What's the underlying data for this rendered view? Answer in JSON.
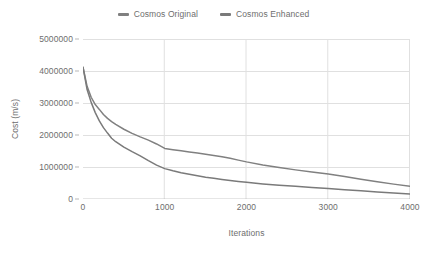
{
  "chart_data": {
    "type": "line",
    "title": "",
    "xlabel": "Iterations",
    "ylabel": "Cost (m/s)",
    "xlim": [
      0,
      4000
    ],
    "ylim": [
      0,
      5000000
    ],
    "grid": true,
    "legend_position": "top-center",
    "xticks": [
      0,
      1000,
      2000,
      3000,
      4000
    ],
    "xticklabels": [
      "0",
      "1000",
      "2000",
      "3000",
      "4000"
    ],
    "yticks": [
      0,
      1000000,
      2000000,
      3000000,
      4000000,
      5000000
    ],
    "yticklabels": [
      "0",
      "1000000",
      "2000000",
      "3000000",
      "4000000",
      "5000000"
    ],
    "x": [
      0,
      50,
      100,
      150,
      200,
      250,
      300,
      350,
      400,
      500,
      600,
      700,
      800,
      900,
      1000,
      1100,
      1200,
      1300,
      1400,
      1500,
      1600,
      1700,
      1800,
      1900,
      2000,
      2200,
      2400,
      2600,
      2800,
      3000,
      3200,
      3400,
      3600,
      3800,
      4000
    ],
    "series": [
      {
        "name": "Cosmos Original",
        "color": "#808080",
        "values": [
          4120000,
          3520000,
          3180000,
          2950000,
          2800000,
          2640000,
          2520000,
          2420000,
          2330000,
          2180000,
          2050000,
          1940000,
          1840000,
          1720000,
          1580000,
          1540000,
          1505000,
          1470000,
          1435000,
          1400000,
          1360000,
          1320000,
          1270000,
          1215000,
          1160000,
          1065000,
          985000,
          910000,
          845000,
          780000,
          700000,
          620000,
          540000,
          465000,
          400000
        ]
      },
      {
        "name": "Cosmos Enhanced",
        "color": "#7a7a7a",
        "values": [
          4120000,
          3420000,
          3020000,
          2700000,
          2440000,
          2230000,
          2060000,
          1900000,
          1790000,
          1620000,
          1480000,
          1350000,
          1200000,
          1060000,
          950000,
          880000,
          820000,
          770000,
          725000,
          680000,
          645000,
          610000,
          575000,
          545000,
          520000,
          470000,
          430000,
          395000,
          360000,
          325000,
          290000,
          255000,
          220000,
          185000,
          155000
        ]
      }
    ]
  },
  "legend": {
    "entries": [
      {
        "label": "Cosmos Original"
      },
      {
        "label": "Cosmos Enhanced"
      }
    ]
  },
  "colors": {
    "series_original": "#808080",
    "series_enhanced": "#7a7a7a",
    "grid": "#e0e0e0",
    "axis": "#b7b7b7",
    "baseline": "#9a9a9a",
    "text": "#6e6e6e",
    "background": "#ffffff"
  }
}
